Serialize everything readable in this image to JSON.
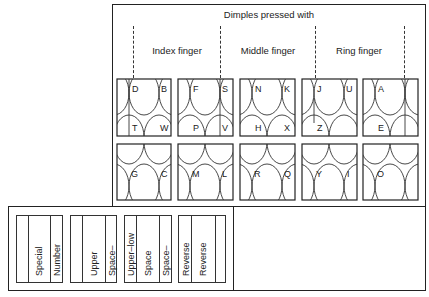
{
  "title": "Dimples pressed with",
  "fingers": [
    {
      "label": "Index finger"
    },
    {
      "label": "Middle finger"
    },
    {
      "label": "Ring finger"
    }
  ],
  "top_row_keys": [
    {
      "letters": {
        "top_left": "D",
        "top_right": "B",
        "bottom_left": "T",
        "bottom_right": "W"
      }
    },
    {
      "letters": {
        "top_left": "F",
        "top_right": "S",
        "bottom_left": "P",
        "bottom_right": "V"
      }
    },
    {
      "letters": {
        "top_left": "N",
        "top_right": "K",
        "bottom_left": "H",
        "bottom_right": "X"
      }
    },
    {
      "letters": {
        "top_left": "J",
        "top_right": "U",
        "bottom_left": "Z",
        "bottom_right": ""
      }
    },
    {
      "letters": {
        "top_left": "A",
        "top_right": "",
        "bottom_left": "E",
        "bottom_right": ""
      }
    }
  ],
  "bottom_row_keys": [
    {
      "letters": {
        "left": "G",
        "right": "C"
      }
    },
    {
      "letters": {
        "left": "M",
        "right": "L"
      }
    },
    {
      "letters": {
        "left": "R",
        "right": "Q"
      }
    },
    {
      "letters": {
        "left": "Y",
        "right": "I"
      }
    },
    {
      "letters": {
        "left": "O",
        "right": ""
      }
    }
  ],
  "bar_keys": [
    {
      "labels": [
        "",
        "Special",
        "Number"
      ]
    },
    {
      "labels": [
        "",
        "Upper",
        "Space–"
      ]
    },
    {
      "labels": [
        "Upper–low",
        "Space",
        "Space–"
      ]
    },
    {
      "labels": [
        "Reverse",
        "Reverse",
        ""
      ]
    }
  ]
}
